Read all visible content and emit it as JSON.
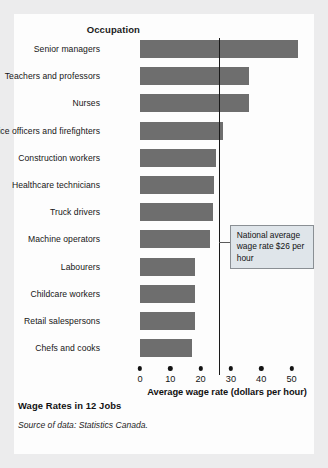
{
  "figure": {
    "caption": "Wage Rates in 12 Jobs",
    "source": "Source of data: Statistics Canada.",
    "occupation_heading": "Occupation",
    "callout": "National average wage rate $26 per hour",
    "bar_color": "#6e6e6e",
    "callout_fill": "#dfe5ea",
    "background": "#fdfdfd"
  },
  "chart_data": {
    "type": "bar",
    "orientation": "horizontal",
    "title": "Wage Rates in 12 Jobs",
    "xlabel": "Average wage rate (dollars per hour)",
    "ylabel": "Occupation",
    "xlim": [
      0,
      52
    ],
    "xticks": [
      0,
      10,
      20,
      30,
      40,
      50
    ],
    "xticklabels": [
      "0",
      "10",
      "20",
      "30",
      "40",
      "50"
    ],
    "grid": false,
    "legend": null,
    "categories": [
      "Senior managers",
      "Teachers and professors",
      "Nurses",
      "Police officers and firefighters",
      "Construction workers",
      "Healthcare technicians",
      "Truck drivers",
      "Machine operators",
      "Labourers",
      "Childcare workers",
      "Retail salespersons",
      "Chefs and cooks"
    ],
    "values": [
      52,
      36,
      36,
      27.5,
      25,
      24.5,
      24,
      23,
      18,
      18,
      18,
      17
    ],
    "annotations": [
      {
        "type": "vline",
        "value": 26,
        "label": "National average wage rate $26 per hour"
      }
    ]
  }
}
